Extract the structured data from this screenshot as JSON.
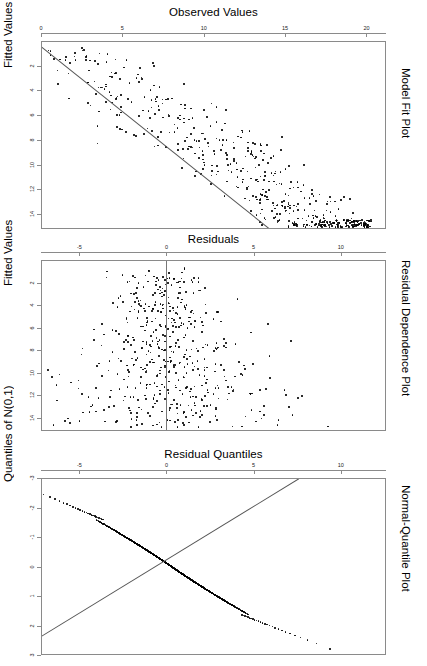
{
  "figure": {
    "kind": "regression-diagnostic-panels",
    "panel_count": 3,
    "point_color": "#000000",
    "frame_color": "#8a8a8a",
    "line_color": "#555555",
    "background": "#ffffff"
  },
  "panels": [
    {
      "id": "model-fit-plot",
      "top_title": "Observed Values",
      "left_title": "Fitted Values",
      "right_title": "Model Fit Plot",
      "chart_data": {
        "type": "scatter",
        "title": "Model Fit Plot",
        "xlabel": "Observed Values",
        "ylabel": "Fitted Values",
        "xlim": [
          0,
          21.2
        ],
        "ylim": [
          0,
          15.2
        ],
        "y_inverted": true,
        "grid": false,
        "legend": "none",
        "xticks": [
          0,
          5,
          10,
          15,
          20
        ],
        "yticks": [
          2,
          4,
          6,
          8,
          10,
          12,
          14
        ],
        "n_points": 520,
        "fit_line": {
          "x0": 0.0,
          "y0": 0.4,
          "x1": 14.1,
          "y1": 15.2
        },
        "trend": "negative",
        "note": "points scatter about a descending reference line"
      }
    },
    {
      "id": "residual-dependence-plot",
      "top_title": "Residuals",
      "left_title": "Fitted Values",
      "right_title": "Residual Dependence Plot",
      "chart_data": {
        "type": "scatter",
        "title": "Residual Dependence Plot",
        "xlabel": "Residuals",
        "ylabel": "Fitted Values",
        "xlim": [
          -7.2,
          12.6
        ],
        "ylim": [
          0,
          15.2
        ],
        "y_inverted": true,
        "grid": false,
        "legend": "none",
        "xticks": [
          -5,
          0,
          5,
          10
        ],
        "yticks": [
          2,
          4,
          6,
          8,
          10,
          12,
          14
        ],
        "n_points": 520,
        "vline_at": 0,
        "trend": "funnel",
        "note": "residual cloud centred near zero, spread widens for larger fitted values"
      }
    },
    {
      "id": "normal-quantile-plot",
      "top_title": "Residual Quantiles",
      "left_title": "Quantiles of N(0,1)",
      "right_title": "Normal-Quantile Plot",
      "chart_data": {
        "type": "scatter",
        "title": "Normal-Quantile Plot",
        "xlabel": "Residual Quantiles",
        "ylabel": "Quantiles of N(0,1)",
        "xlim": [
          -7.2,
          12.6
        ],
        "ylim": [
          -3,
          3
        ],
        "y_inverted": true,
        "grid": false,
        "legend": "none",
        "xticks": [
          -5,
          0,
          5,
          10
        ],
        "yticks": [
          3,
          2,
          1,
          0,
          -1,
          -2,
          -3
        ],
        "n_points": 520,
        "fit_line": {
          "x0": -7.2,
          "y0": 2.35,
          "x1": 7.6,
          "y1": -3.0
        },
        "trend": "s-curve",
        "note": "quantile curve departs above the reference line in the left tail and below it in the right tail"
      }
    }
  ]
}
